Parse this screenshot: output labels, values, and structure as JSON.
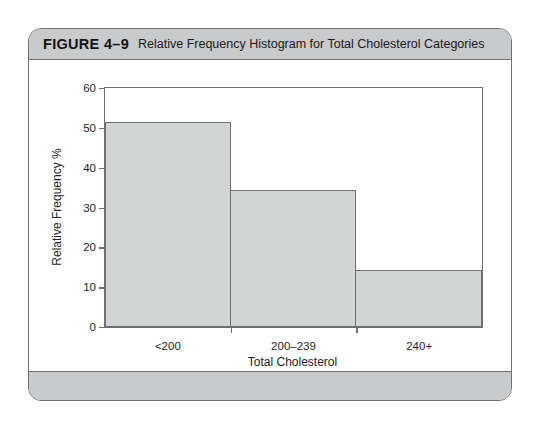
{
  "figure": {
    "number": "FIGURE 4–9",
    "caption": "Relative Frequency Histogram for Total Cholesterol Categories",
    "header_color": "#c9cacb",
    "border_color": "#6e7275"
  },
  "chart_data": {
    "type": "bar",
    "title": "Relative Frequency Histogram for Total Cholesterol Categories",
    "categories": [
      "<200",
      "200–239",
      "240+"
    ],
    "values": [
      51.5,
      34.3,
      14.2
    ],
    "xlabel": "Total Cholesterol",
    "ylabel": "Relative Frequency %",
    "ylim": [
      0,
      60
    ],
    "yticks": [
      0,
      10,
      20,
      30,
      40,
      50,
      60
    ],
    "ytick_labels": [
      "0",
      "10",
      "20",
      "30",
      "40",
      "50",
      "60"
    ],
    "grid": false,
    "legend": null,
    "bar_fill": "#d3d4d4",
    "bar_edge": "#6d7073"
  }
}
